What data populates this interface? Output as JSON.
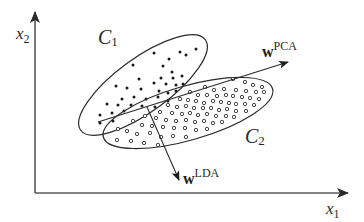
{
  "figure": {
    "width": 364,
    "height": 222
  },
  "axes": {
    "origin": [
      35,
      193
    ],
    "y_axis_top": [
      35,
      12
    ],
    "x_axis_right": [
      348,
      193
    ],
    "x_label": {
      "main": "x",
      "sub": "1",
      "pos": [
        326,
        214
      ]
    },
    "y_label": {
      "main": "x",
      "sub": "2",
      "pos": [
        16,
        39
      ]
    },
    "color": "#5a5a5a"
  },
  "classes": [
    {
      "id": "C1",
      "label": {
        "main": "C",
        "sub": "1",
        "pos": [
          98,
          44
        ]
      },
      "ellipse": {
        "cx": 143,
        "cy": 85,
        "rx": 77,
        "ry": 27,
        "angle": -36
      },
      "marker": "filled",
      "points": [
        [
          154,
          53
        ],
        [
          169,
          59
        ],
        [
          180,
          52
        ],
        [
          186,
          55
        ],
        [
          196,
          49
        ],
        [
          133,
          65
        ],
        [
          163,
          66
        ],
        [
          172,
          72
        ],
        [
          161,
          78
        ],
        [
          173,
          78
        ],
        [
          182,
          76
        ],
        [
          139,
          79
        ],
        [
          154,
          83
        ],
        [
          166,
          84
        ],
        [
          176,
          85
        ],
        [
          183,
          84
        ],
        [
          116,
          86
        ],
        [
          127,
          88
        ],
        [
          141,
          89
        ],
        [
          159,
          91
        ],
        [
          168,
          93
        ],
        [
          176,
          91
        ],
        [
          122,
          99
        ],
        [
          134,
          97
        ],
        [
          146,
          99
        ],
        [
          158,
          97
        ],
        [
          168,
          101
        ],
        [
          180,
          99
        ],
        [
          107,
          104
        ],
        [
          118,
          105
        ],
        [
          131,
          105
        ],
        [
          142,
          106
        ],
        [
          155,
          107
        ],
        [
          100,
          115
        ],
        [
          112,
          113
        ],
        [
          124,
          111
        ],
        [
          100,
          123
        ],
        [
          113,
          121
        ]
      ]
    },
    {
      "id": "C2",
      "label": {
        "main": "C",
        "sub": "2",
        "pos": [
          245,
          143
        ]
      },
      "ellipse": {
        "cx": 188,
        "cy": 113,
        "rx": 88,
        "ry": 27,
        "angle": -16
      },
      "marker": "hollow",
      "points": [
        [
          233,
          79
        ],
        [
          245,
          82
        ],
        [
          253,
          85
        ],
        [
          262,
          87
        ],
        [
          205,
          87
        ],
        [
          214,
          90
        ],
        [
          224,
          89
        ],
        [
          236,
          90
        ],
        [
          246,
          91
        ],
        [
          256,
          92
        ],
        [
          264,
          92
        ],
        [
          190,
          92
        ],
        [
          198,
          95
        ],
        [
          207,
          95
        ],
        [
          217,
          96
        ],
        [
          226,
          95
        ],
        [
          233,
          96
        ],
        [
          242,
          97
        ],
        [
          250,
          98
        ],
        [
          259,
          99
        ],
        [
          180,
          99
        ],
        [
          188,
          100
        ],
        [
          196,
          101
        ],
        [
          204,
          103
        ],
        [
          213,
          101
        ],
        [
          221,
          102
        ],
        [
          229,
          103
        ],
        [
          236,
          104
        ],
        [
          245,
          104
        ],
        [
          254,
          105
        ],
        [
          168,
          105
        ],
        [
          177,
          107
        ],
        [
          186,
          106
        ],
        [
          194,
          108
        ],
        [
          203,
          108
        ],
        [
          211,
          108
        ],
        [
          219,
          110
        ],
        [
          227,
          109
        ],
        [
          236,
          111
        ],
        [
          246,
          111
        ],
        [
          160,
          112
        ],
        [
          172,
          113
        ],
        [
          182,
          114
        ],
        [
          190,
          113
        ],
        [
          198,
          115
        ],
        [
          207,
          114
        ],
        [
          216,
          116
        ],
        [
          226,
          116
        ],
        [
          234,
          117
        ],
        [
          145,
          116
        ],
        [
          156,
          118
        ],
        [
          166,
          120
        ],
        [
          176,
          121
        ],
        [
          186,
          120
        ],
        [
          195,
          122
        ],
        [
          204,
          121
        ],
        [
          213,
          123
        ],
        [
          222,
          122
        ],
        [
          133,
          121
        ],
        [
          142,
          125
        ],
        [
          152,
          126
        ],
        [
          163,
          127
        ],
        [
          174,
          128
        ],
        [
          185,
          128
        ],
        [
          196,
          130
        ],
        [
          207,
          129
        ],
        [
          118,
          129
        ],
        [
          127,
          131
        ],
        [
          137,
          134
        ],
        [
          150,
          133
        ],
        [
          161,
          137
        ],
        [
          173,
          136
        ],
        [
          186,
          137
        ],
        [
          117,
          140
        ],
        [
          131,
          141
        ],
        [
          144,
          143
        ],
        [
          158,
          145
        ]
      ]
    }
  ],
  "vectors": [
    {
      "id": "w_pca",
      "label": {
        "bold": "w",
        "sup": "PCA",
        "pos": [
          262,
          57
        ]
      },
      "from": [
        98,
        122
      ],
      "to": [
        288,
        62
      ]
    },
    {
      "id": "w_lda",
      "label": {
        "bold": "w",
        "sup": "LDA",
        "pos": [
          183,
          184
        ]
      },
      "from": [
        147,
        107
      ],
      "to": [
        179,
        180
      ]
    }
  ],
  "colors": {
    "line": "#2b2b2b",
    "axis": "#5a5a5a",
    "filled_dot": "#1a1a1a",
    "hollow_dot_stroke": "#444444",
    "background": "#ffffff"
  }
}
